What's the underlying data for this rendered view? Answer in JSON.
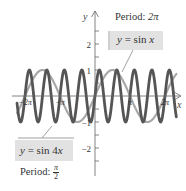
{
  "chart_data": {
    "type": "line",
    "title": "",
    "xlabel": "x",
    "ylabel": "y",
    "xlim": [
      -7.0,
      7.3
    ],
    "ylim": [
      -2.9,
      3.2
    ],
    "grid": false,
    "x_ticks": [
      {
        "value": -6.2832,
        "label": "-2π"
      },
      {
        "value": -3.1416,
        "label": "-π"
      },
      {
        "value": 3.1416,
        "label": "π"
      },
      {
        "value": 6.2832,
        "label": "2π"
      }
    ],
    "y_ticks": [
      {
        "value": 2,
        "label": "2"
      },
      {
        "value": 1,
        "label": "1"
      },
      {
        "value": -1,
        "label": "-1"
      },
      {
        "value": -2,
        "label": "-2"
      }
    ],
    "y_minor_ticks": [
      2.5,
      1.5,
      0.5,
      -0.5,
      -1.5,
      -2.5
    ],
    "series": [
      {
        "name": "y = sin x",
        "function": "sin(x)",
        "period": "2π",
        "color": "#a8a8a8",
        "stroke_width": 2.2
      },
      {
        "name": "y = sin 4x",
        "function": "sin(4x)",
        "period": "π/2",
        "color": "#555555",
        "stroke_width": 2.8
      }
    ],
    "annotations": [
      {
        "text": "Period: 2π",
        "series": "y = sin x"
      },
      {
        "text": "Period: π/2",
        "series": "y = sin 4x"
      }
    ]
  },
  "labels": {
    "sinx": {
      "prefix": "y",
      "eq": " = sin ",
      "var": "x"
    },
    "sin4x": {
      "prefix": "y",
      "eq": " = sin 4",
      "var": "x"
    },
    "period_sinx": {
      "text": "Period: ",
      "value": "2π"
    },
    "period_sin4x": {
      "text": "Period: ",
      "num": "π",
      "den": "2"
    }
  },
  "axes": {
    "x_label": "x",
    "y_label": "y"
  }
}
